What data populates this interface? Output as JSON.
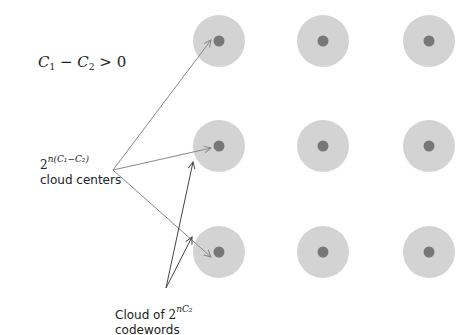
{
  "diagram": {
    "condition": {
      "lhs_c1": "C",
      "lhs_c1_sub": "1",
      "minus": " − ",
      "lhs_c2": "C",
      "lhs_c2_sub": "2",
      "rel": " > 0"
    },
    "centers_label": {
      "base": "2",
      "exponent": "n(C₁−C₂)",
      "text": "cloud centers"
    },
    "codewords_label": {
      "prefix": "Cloud of ",
      "base": "2",
      "exponent": "nC₂",
      "text": "codewords"
    },
    "grid": {
      "rows": 3,
      "cols": 3,
      "col_x": [
        219,
        323,
        429
      ],
      "row_y": [
        41,
        146,
        252
      ],
      "cloud_radius": 26,
      "center_radius": 5.5,
      "cloud_color": "#d3d3d3",
      "center_color": "#777777"
    },
    "arrows": {
      "color": "#888888",
      "codeword_color": "#444444",
      "from_centers_label": [
        {
          "from": [
            113,
            170
          ],
          "to": [
            211,
            40
          ]
        },
        {
          "from": [
            113,
            170
          ],
          "to": [
            211,
            148
          ]
        },
        {
          "from": [
            113,
            170
          ],
          "to": [
            211,
            257
          ]
        }
      ],
      "from_codewords_label": [
        {
          "from": [
            166,
            288
          ],
          "to": [
            193,
            162
          ]
        },
        {
          "from": [
            166,
            288
          ],
          "to": [
            192,
            237
          ]
        }
      ]
    }
  }
}
